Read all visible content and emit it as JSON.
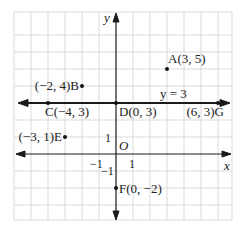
{
  "diagram": {
    "type": "coordinate-plane",
    "axes": {
      "x_label": "x",
      "y_label": "y",
      "origin_label": "O",
      "x_range": [
        -6,
        6.8
      ],
      "y_range": [
        -3.9,
        8.4
      ],
      "ticks": {
        "x_pos": "1",
        "x_neg": "−1",
        "y_pos": "1",
        "y_neg": "−1"
      }
    },
    "line": {
      "label": "y = 3",
      "equation": "y = 3",
      "y": 3
    },
    "points": [
      {
        "id": "A",
        "x": 3,
        "y": 5,
        "label": "A(3, 5)"
      },
      {
        "id": "B",
        "x": -2,
        "y": 4,
        "label": "(−2, 4)B"
      },
      {
        "id": "C",
        "x": -4,
        "y": 3,
        "label": "C(−4, 3)"
      },
      {
        "id": "D",
        "x": 0,
        "y": 3,
        "label": "D(0, 3)"
      },
      {
        "id": "G",
        "x": 6,
        "y": 3,
        "label": "(6, 3)G"
      },
      {
        "id": "E",
        "x": -3,
        "y": 1,
        "label": "(−3, 1)E"
      },
      {
        "id": "F",
        "x": 0,
        "y": -2,
        "label": "F(0, −2)"
      }
    ],
    "colors": {
      "grid": "#d9d9d9",
      "axis": "#1a1a1a",
      "point": "#111111",
      "background": "#ffffff"
    }
  }
}
